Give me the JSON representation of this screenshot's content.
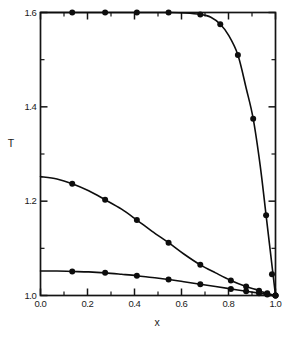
{
  "chart_data": {
    "type": "line",
    "title": "",
    "xlabel": "x",
    "ylabel": "T",
    "xlim": [
      0.0,
      1.0
    ],
    "ylim": [
      1.0,
      1.6
    ],
    "grid": false,
    "legend": "none",
    "x_ticks": [
      "0.0",
      "0.2",
      "0.4",
      "0.6",
      "0.8",
      "1.0"
    ],
    "x_tick_values": [
      0.0,
      0.2,
      0.4,
      0.6,
      0.8,
      1.0
    ],
    "x_minor_ticks": [
      0.1,
      0.3,
      0.5,
      0.7,
      0.9
    ],
    "y_ticks": [
      "1.0",
      "1.2",
      "1.4",
      "1.6"
    ],
    "y_tick_values": [
      1.0,
      1.2,
      1.4,
      1.6
    ],
    "y_minor_ticks": [
      1.1,
      1.3,
      1.5
    ],
    "series": [
      {
        "name": "upper-curve",
        "marker": "filled-circle",
        "x": [
          0.0,
          0.065,
          0.135,
          0.205,
          0.275,
          0.345,
          0.41,
          0.48,
          0.545,
          0.615,
          0.68,
          0.725,
          0.765,
          0.8,
          0.84,
          0.875,
          0.905,
          0.935,
          0.96,
          0.98,
          1.0
        ],
        "y": [
          1.6,
          1.6,
          1.6,
          1.6,
          1.6,
          1.6,
          1.6,
          1.6,
          1.6,
          1.599,
          1.596,
          1.59,
          1.575,
          1.552,
          1.51,
          1.44,
          1.375,
          1.275,
          1.17,
          1.085,
          1.0
        ],
        "marker_x": [
          0.135,
          0.275,
          0.41,
          0.545,
          0.68,
          0.765,
          0.84,
          0.905,
          0.96,
          0.985,
          1.0
        ],
        "marker_y": [
          1.6,
          1.6,
          1.6,
          1.6,
          1.596,
          1.575,
          1.51,
          1.375,
          1.17,
          1.045,
          1.0
        ]
      },
      {
        "name": "middle-curve",
        "marker": "filled-circle",
        "x": [
          0.0,
          0.07,
          0.135,
          0.205,
          0.275,
          0.345,
          0.41,
          0.475,
          0.545,
          0.61,
          0.68,
          0.745,
          0.81,
          0.875,
          0.915,
          0.95,
          0.975,
          1.0
        ],
        "y": [
          1.252,
          1.247,
          1.237,
          1.222,
          1.203,
          1.183,
          1.16,
          1.136,
          1.112,
          1.088,
          1.065,
          1.048,
          1.032,
          1.019,
          1.013,
          1.007,
          1.003,
          1.0
        ],
        "marker_x": [
          0.135,
          0.275,
          0.41,
          0.545,
          0.68,
          0.81,
          0.875,
          0.93,
          0.965,
          1.0
        ],
        "marker_y": [
          1.237,
          1.203,
          1.16,
          1.112,
          1.065,
          1.032,
          1.019,
          1.01,
          1.005,
          1.0
        ]
      },
      {
        "name": "lower-curve",
        "marker": "filled-circle",
        "x": [
          0.0,
          0.07,
          0.135,
          0.205,
          0.275,
          0.345,
          0.41,
          0.475,
          0.545,
          0.61,
          0.68,
          0.745,
          0.81,
          0.875,
          0.93,
          0.965,
          1.0
        ],
        "y": [
          1.052,
          1.052,
          1.051,
          1.05,
          1.048,
          1.045,
          1.042,
          1.038,
          1.034,
          1.029,
          1.024,
          1.019,
          1.014,
          1.009,
          1.005,
          1.002,
          1.0
        ],
        "marker_x": [
          0.135,
          0.275,
          0.41,
          0.545,
          0.68,
          0.81,
          0.875,
          0.93,
          0.965,
          1.0
        ],
        "marker_y": [
          1.051,
          1.048,
          1.042,
          1.034,
          1.024,
          1.014,
          1.009,
          1.005,
          1.002,
          1.0
        ]
      }
    ]
  }
}
